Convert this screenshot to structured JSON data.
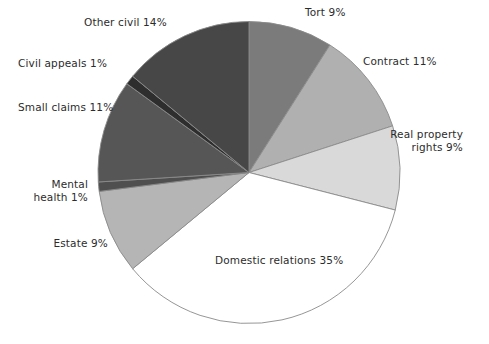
{
  "chart_data": {
    "type": "pie",
    "title": "",
    "subtitle": "",
    "xlabel": "",
    "ylabel": "",
    "legend_position": "none",
    "grid": false,
    "start_angle_deg": 0,
    "direction": "clockwise",
    "unit": "%",
    "categories": [
      "Tort",
      "Contract",
      "Real property rights",
      "Domestic relations",
      "Estate",
      "Mental health",
      "Small claims",
      "Civil appeals",
      "Other civil"
    ],
    "values": [
      9,
      11,
      9,
      35,
      9,
      1,
      11,
      1,
      14
    ],
    "colors": [
      "#7b7b7b",
      "#b0b0b0",
      "#d9d9d9",
      "#ffffff",
      "#b5b5b5",
      "#4f4f4f",
      "#565656",
      "#2e2e2e",
      "#474747"
    ],
    "slice_outline_color": "#8a8a8a",
    "slices": [
      {
        "label": "Tort 9%",
        "name": "Tort",
        "value": 9,
        "color": "#7b7b7b"
      },
      {
        "label": "Contract 11%",
        "name": "Contract",
        "value": 11,
        "color": "#b0b0b0"
      },
      {
        "label": "Real property rights 9%",
        "name": "Real property rights",
        "value": 9,
        "color": "#d9d9d9"
      },
      {
        "label": "Domestic relations 35%",
        "name": "Domestic relations",
        "value": 35,
        "color": "#ffffff"
      },
      {
        "label": "Estate 9%",
        "name": "Estate",
        "value": 9,
        "color": "#b5b5b5"
      },
      {
        "label": "Mental health 1%",
        "name": "Mental health",
        "value": 1,
        "color": "#4f4f4f"
      },
      {
        "label": "Small claims 11%",
        "name": "Small claims",
        "value": 11,
        "color": "#565656"
      },
      {
        "label": "Civil appeals 1%",
        "name": "Civil appeals",
        "value": 1,
        "color": "#2e2e2e"
      },
      {
        "label": "Other civil 14%",
        "name": "Other civil",
        "value": 14,
        "color": "#474747"
      }
    ]
  },
  "labels": {
    "tort": "Tort 9%",
    "contract": "Contract 11%",
    "real_property_line1": "Real property",
    "real_property_line2": "rights 9%",
    "domestic_relations": "Domestic relations 35%",
    "estate": "Estate 9%",
    "mental_health_line1": "Mental",
    "mental_health_line2": "health 1%",
    "small_claims": "Small claims 11%",
    "civil_appeals": "Civil appeals 1%",
    "other_civil": "Other civil 14%"
  }
}
